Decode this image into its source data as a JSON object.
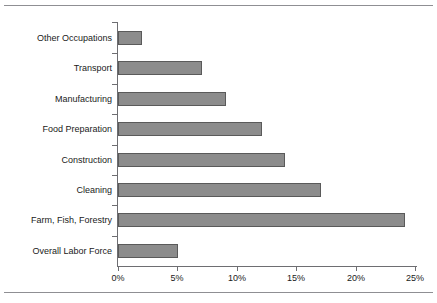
{
  "chart": {
    "type": "bar",
    "orientation": "horizontal",
    "title": "",
    "subtitle": "",
    "xlabel": "",
    "ylabel": "",
    "grid": false,
    "legend": null,
    "bar_fill_color": "#8c8c8c",
    "bar_border_color": "#5a5a5a",
    "axis_color": "#6e6e72",
    "rule_color": "#8f8f93",
    "background_color": "#ffffff",
    "text_color": "#1a1a1a"
  },
  "chart_data": {
    "type": "bar",
    "orientation": "horizontal",
    "title": "",
    "xlabel": "",
    "ylabel": "",
    "xlim": [
      0,
      25
    ],
    "xticks": [
      0,
      5,
      10,
      15,
      20,
      25
    ],
    "xtick_labels": [
      "0%",
      "5%",
      "10%",
      "15%",
      "20%",
      "25%"
    ],
    "grid": false,
    "categories": [
      "Other Occupations",
      "Transport",
      "Manufacturing",
      "Food Preparation",
      "Construction",
      "Cleaning",
      "Farm, Fish, Forestry",
      "Overall Labor Force"
    ],
    "values": [
      2,
      7,
      9,
      12,
      14,
      17,
      24,
      5
    ],
    "value_labels": [
      "2%",
      "7%",
      "9%",
      "12%",
      "14%",
      "17%",
      "24%",
      "5%"
    ],
    "series": [
      {
        "name": "",
        "values": [
          2,
          7,
          9,
          12,
          14,
          17,
          24,
          5
        ]
      }
    ]
  }
}
